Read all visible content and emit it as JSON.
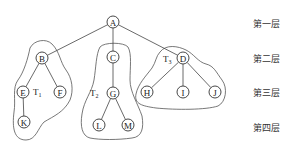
{
  "diagram": {
    "type": "tree",
    "root": "A",
    "nodes": [
      {
        "id": "A",
        "label": "A",
        "level": 1,
        "x": 113,
        "y": 22
      },
      {
        "id": "B",
        "label": "B",
        "level": 2,
        "x": 42,
        "y": 58
      },
      {
        "id": "C",
        "label": "C",
        "level": 2,
        "x": 113,
        "y": 57
      },
      {
        "id": "D",
        "label": "D",
        "level": 2,
        "x": 183,
        "y": 58
      },
      {
        "id": "E",
        "label": "E",
        "level": 3,
        "x": 23,
        "y": 92
      },
      {
        "id": "F",
        "label": "F",
        "level": 3,
        "x": 60,
        "y": 92
      },
      {
        "id": "G",
        "label": "G",
        "level": 3,
        "x": 113,
        "y": 93
      },
      {
        "id": "H",
        "label": "H",
        "level": 3,
        "x": 147,
        "y": 92
      },
      {
        "id": "I",
        "label": "I",
        "level": 3,
        "x": 183,
        "y": 92
      },
      {
        "id": "J",
        "label": "J",
        "level": 3,
        "x": 215,
        "y": 92
      },
      {
        "id": "K",
        "label": "K",
        "level": 4,
        "x": 24,
        "y": 122
      },
      {
        "id": "L",
        "label": "L",
        "level": 4,
        "x": 99,
        "y": 125
      },
      {
        "id": "M",
        "label": "M",
        "level": 4,
        "x": 128,
        "y": 125
      }
    ],
    "edges": [
      [
        "A",
        "B"
      ],
      [
        "A",
        "C"
      ],
      [
        "A",
        "D"
      ],
      [
        "B",
        "E"
      ],
      [
        "B",
        "F"
      ],
      [
        "E",
        "K"
      ],
      [
        "C",
        "G"
      ],
      [
        "G",
        "L"
      ],
      [
        "G",
        "M"
      ],
      [
        "D",
        "H"
      ],
      [
        "D",
        "I"
      ],
      [
        "D",
        "J"
      ]
    ],
    "subtrees": [
      {
        "name": "T",
        "sub": "1",
        "x": 33,
        "y": 95
      },
      {
        "name": "T",
        "sub": "2",
        "x": 90,
        "y": 96
      },
      {
        "name": "T",
        "sub": "3",
        "x": 163,
        "y": 62
      }
    ],
    "levels": [
      {
        "label": "第一层",
        "y": 17
      },
      {
        "label": "第二层",
        "y": 52
      },
      {
        "label": "第三层",
        "y": 86
      },
      {
        "label": "第四层",
        "y": 121
      }
    ]
  }
}
